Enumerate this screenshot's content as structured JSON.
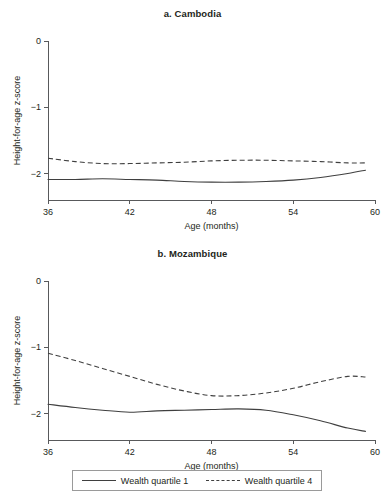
{
  "figure": {
    "background_color": "#ffffff",
    "line_color": "#3f3f3f",
    "axis_color": "#58595b",
    "text_color": "#231f20"
  },
  "legend": {
    "position": "bottom-center",
    "entries": [
      {
        "label": "Wealth quartile 1",
        "style": "solid"
      },
      {
        "label": "Wealth quartile 4",
        "style": "dashed"
      }
    ]
  },
  "chart_data": [
    {
      "type": "line",
      "title": "a. Cambodia",
      "xlabel": "Age (months)",
      "ylabel": "Height-for-age z-score",
      "xlim": [
        36,
        60
      ],
      "ylim": [
        -2.4,
        0
      ],
      "xticks": [
        36,
        42,
        48,
        54,
        60
      ],
      "xtick_labels": [
        "36",
        "42",
        "48",
        "54",
        "60"
      ],
      "yticks": [
        0,
        -1,
        -2
      ],
      "ytick_labels": [
        "0",
        "-1",
        "-2"
      ],
      "grid": false,
      "x": [
        36,
        38,
        40,
        42,
        44,
        46,
        48,
        50,
        52,
        54,
        56,
        58,
        59.3
      ],
      "series": [
        {
          "name": "Wealth quartile 1",
          "style": "solid",
          "values": [
            -2.09,
            -2.09,
            -2.08,
            -2.09,
            -2.1,
            -2.12,
            -2.13,
            -2.13,
            -2.12,
            -2.1,
            -2.06,
            -2.0,
            -1.95
          ]
        },
        {
          "name": "Wealth quartile 4",
          "style": "dashed",
          "values": [
            -1.77,
            -1.82,
            -1.85,
            -1.85,
            -1.84,
            -1.83,
            -1.81,
            -1.8,
            -1.8,
            -1.81,
            -1.82,
            -1.84,
            -1.84
          ]
        }
      ]
    },
    {
      "type": "line",
      "title": "b. Mozambique",
      "xlabel": "Age (months)",
      "ylabel": "Height-for-age z-score",
      "xlim": [
        36,
        60
      ],
      "ylim": [
        -2.4,
        0
      ],
      "xticks": [
        36,
        42,
        48,
        54,
        60
      ],
      "xtick_labels": [
        "36",
        "42",
        "48",
        "54",
        "60"
      ],
      "yticks": [
        0,
        -1,
        -2
      ],
      "ytick_labels": [
        "0",
        "-1",
        "-2"
      ],
      "grid": false,
      "x": [
        36,
        38,
        40,
        42,
        44,
        46,
        48,
        50,
        52,
        54,
        56,
        58,
        59.3
      ],
      "series": [
        {
          "name": "Wealth quartile 1",
          "style": "solid",
          "values": [
            -1.86,
            -1.91,
            -1.95,
            -1.98,
            -1.96,
            -1.95,
            -1.94,
            -1.93,
            -1.95,
            -2.02,
            -2.11,
            -2.22,
            -2.27
          ]
        },
        {
          "name": "Wealth quartile 4",
          "style": "dashed",
          "values": [
            -1.09,
            -1.2,
            -1.32,
            -1.44,
            -1.56,
            -1.66,
            -1.73,
            -1.73,
            -1.69,
            -1.62,
            -1.52,
            -1.44,
            -1.45
          ]
        }
      ]
    }
  ]
}
